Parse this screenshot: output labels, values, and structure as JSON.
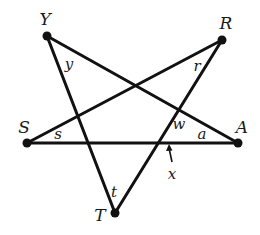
{
  "figure": {
    "colors": {
      "line": "#111111",
      "text": "#1a1a1a",
      "background": "#ffffff"
    },
    "vertices": {
      "Y": {
        "label": "Y",
        "x": 47,
        "y": 36,
        "lx": 45,
        "ly": 25
      },
      "R": {
        "label": "R",
        "x": 222,
        "y": 40,
        "lx": 226,
        "ly": 29
      },
      "S": {
        "label": "S",
        "x": 27,
        "y": 143,
        "lx": 24,
        "ly": 133
      },
      "A": {
        "label": "A",
        "x": 238,
        "y": 143,
        "lx": 242,
        "ly": 133
      },
      "T": {
        "label": "T",
        "x": 115,
        "y": 213,
        "lx": 100,
        "ly": 221
      }
    },
    "segments": [
      {
        "from": "Y",
        "to": "T"
      },
      {
        "from": "Y",
        "to": "A"
      },
      {
        "from": "S",
        "to": "A"
      },
      {
        "from": "S",
        "to": "R"
      },
      {
        "from": "R",
        "to": "T"
      }
    ],
    "angle_labels": {
      "y": {
        "text": "y",
        "x": 69,
        "y": 69
      },
      "r": {
        "text": "r",
        "x": 197,
        "y": 71
      },
      "s": {
        "text": "s",
        "x": 58,
        "y": 139
      },
      "t": {
        "text": "t",
        "x": 114,
        "y": 197
      },
      "w": {
        "text": "w",
        "x": 179,
        "y": 129
      },
      "a": {
        "text": "a",
        "x": 202,
        "y": 139
      }
    },
    "pointer": {
      "label": "x",
      "text_x": 172,
      "text_y": 179,
      "tip_x": 169,
      "tip_y": 144,
      "tail_x": 172,
      "tail_y": 162
    }
  }
}
